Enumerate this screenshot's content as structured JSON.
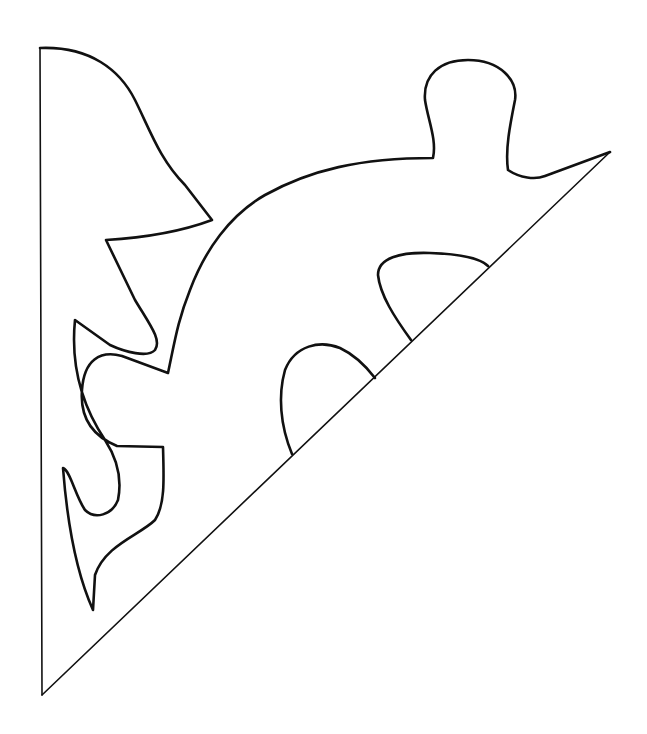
{
  "figure": {
    "stroke_color": "#111111",
    "background_color": "#ffffff",
    "parts": [
      {
        "name": "left-fold-edge"
      },
      {
        "name": "diagonal-fold-edge"
      },
      {
        "name": "outer-cut-outline"
      },
      {
        "name": "inner-cutout-lower"
      },
      {
        "name": "inner-cutout-upper"
      }
    ]
  }
}
